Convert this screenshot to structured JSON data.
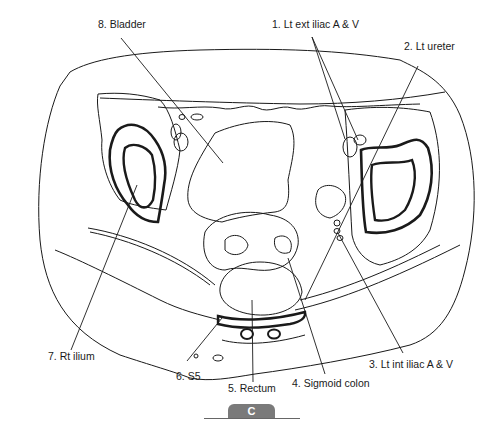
{
  "figure": {
    "type": "cross-sectional anatomical line drawing (axial pelvis)",
    "panel_badge": "C",
    "colors": {
      "line": "#1a1a1a",
      "badge_bg": "#7a7a7a",
      "badge_text": "#ffffff",
      "background": "#ffffff"
    }
  },
  "labels": [
    {
      "id": "1",
      "text": "1. Lt ext iliac A & V"
    },
    {
      "id": "2",
      "text": "2. Lt ureter"
    },
    {
      "id": "3",
      "text": "3. Lt int iliac A & V"
    },
    {
      "id": "4",
      "text": "4. Sigmoid colon"
    },
    {
      "id": "5",
      "text": "5. Rectum"
    },
    {
      "id": "6",
      "text": "6. S5"
    },
    {
      "id": "7",
      "text": "7. Rt ilium"
    },
    {
      "id": "8",
      "text": "8. Bladder"
    }
  ]
}
